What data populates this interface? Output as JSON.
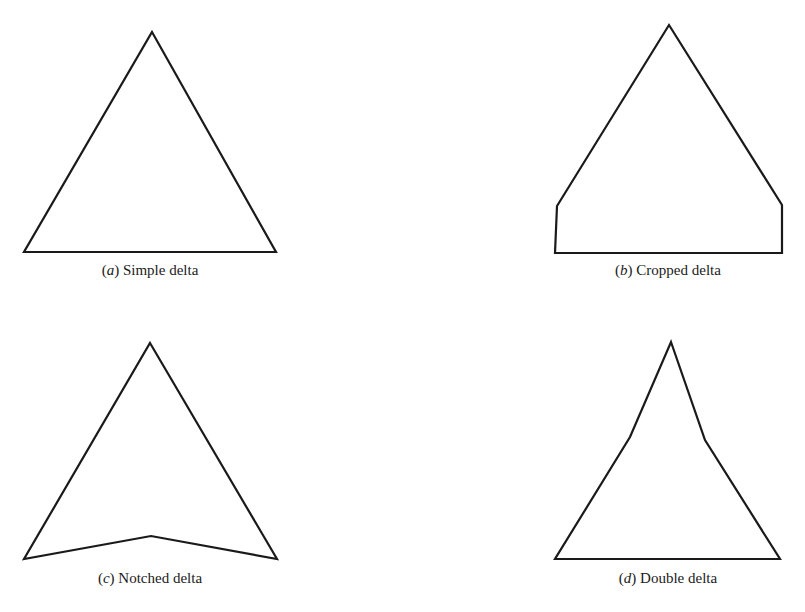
{
  "figures": [
    {
      "id": "a",
      "letter": "a",
      "name": "Simple delta",
      "points": [
        [
          152,
          32
        ],
        [
          276,
          252
        ],
        [
          24,
          252
        ]
      ],
      "caption_pos": [
        150,
        262
      ]
    },
    {
      "id": "b",
      "letter": "b",
      "name": "Cropped delta",
      "points": [
        [
          669,
          25
        ],
        [
          782,
          205
        ],
        [
          782,
          253
        ],
        [
          555,
          253
        ],
        [
          557,
          206
        ]
      ],
      "caption_pos": [
        668,
        262
      ]
    },
    {
      "id": "c",
      "letter": "c",
      "name": "Notched delta",
      "points": [
        [
          150,
          343
        ],
        [
          277,
          559
        ],
        [
          151,
          536
        ],
        [
          24,
          559
        ]
      ],
      "caption_pos": [
        150,
        570
      ]
    },
    {
      "id": "d",
      "letter": "d",
      "name": "Double delta",
      "points": [
        [
          671,
          342
        ],
        [
          705,
          440
        ],
        [
          780,
          559
        ],
        [
          555,
          559
        ],
        [
          630,
          437
        ]
      ],
      "caption_pos": [
        668,
        570
      ]
    }
  ],
  "style": {
    "stroke": "#1a1a1a",
    "stroke_width": 2.2,
    "background": "#ffffff"
  }
}
